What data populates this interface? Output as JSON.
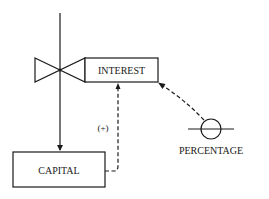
{
  "diagram": {
    "type": "stock-flow",
    "nodes": {
      "interest": {
        "label": "INTEREST",
        "kind": "flow-rate"
      },
      "capital": {
        "label": "CAPITAL",
        "kind": "stock"
      },
      "percentage": {
        "label": "PERCENTAGE",
        "kind": "auxiliary"
      }
    },
    "edges": [
      {
        "from": "source",
        "to": "capital",
        "style": "solid",
        "via": "interest-valve"
      },
      {
        "from": "capital",
        "to": "interest",
        "style": "dashed",
        "label": "(+)"
      },
      {
        "from": "percentage",
        "to": "interest",
        "style": "dashed"
      }
    ],
    "polarity_label": "(+)",
    "colors": {
      "line": "#1a1a1a",
      "background": "#ffffff"
    }
  }
}
